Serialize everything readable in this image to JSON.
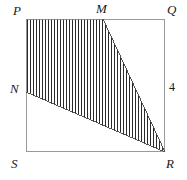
{
  "figure": {
    "type": "geometry-diagram",
    "background_color": "#ffffff",
    "outline_color": "#9a9a9a",
    "hatch_color": "#2b2b2b",
    "hatch_spacing": 3,
    "rectangle": {
      "name": "PQRS",
      "left": 26,
      "top": 19,
      "right": 165,
      "bottom": 152
    },
    "points": [
      {
        "id": "P",
        "label": "P",
        "x": 26,
        "y": 19,
        "role": "rectangle-corner-top-left"
      },
      {
        "id": "M",
        "label": "M",
        "x": 103,
        "y": 19,
        "role": "point-on-top-side"
      },
      {
        "id": "Q",
        "label": "Q",
        "x": 165,
        "y": 19,
        "role": "rectangle-corner-top-right"
      },
      {
        "id": "N",
        "label": "N",
        "x": 26,
        "y": 92,
        "role": "point-on-left-side"
      },
      {
        "id": "S",
        "label": "S",
        "x": 26,
        "y": 152,
        "role": "rectangle-corner-bottom-left"
      },
      {
        "id": "R",
        "label": "R",
        "x": 165,
        "y": 152,
        "role": "rectangle-corner-bottom-right"
      }
    ],
    "shaded_region": {
      "name": "PMRN",
      "vertices": [
        "P",
        "M",
        "R",
        "N"
      ],
      "fill": "vertical-hatch"
    },
    "measurements": [
      {
        "id": "QR",
        "label": "4",
        "side": "right",
        "position": "outside-right"
      }
    ]
  }
}
